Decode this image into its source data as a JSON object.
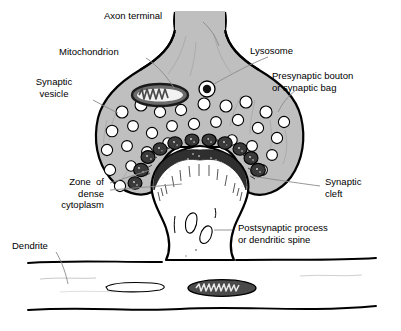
{
  "figure": {
    "background_color": "#ffffff",
    "ink_color": "#000000",
    "cytoplasm_fill": "#bfbfbf",
    "dense_zone_fill": "#3a3a3a",
    "postsynaptic_fill": "#ffffff"
  },
  "labels": {
    "axon_terminal": "Axon terminal",
    "mitochondrion": "Mitochondrion",
    "synaptic_vesicle": "Synaptic\nvesicle",
    "lysosome": "Lysosome",
    "presynaptic_bouton": "Presynaptic bouton\nor synaptic bag",
    "zone_of_dense_cytoplasm": "Zone  of\ndense\ncytoplasm",
    "synaptic_cleft": "Synaptic\ncleft",
    "postsynaptic_process": "Postsynaptic process\nor dendritic spine",
    "dendrite": "Dendrite"
  },
  "structures": {
    "presynaptic_vesicle_count": 31,
    "dense_zone_bump_count": 11,
    "mitochondria_count": 2,
    "lysosome_count": 1,
    "spine_vacuole_count": 3
  }
}
